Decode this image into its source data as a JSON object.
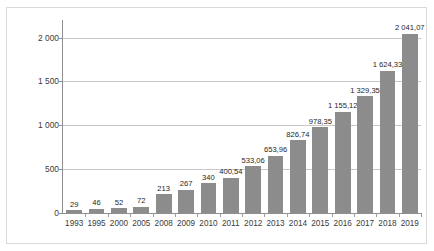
{
  "chart_data": {
    "type": "bar",
    "title": "",
    "xlabel": "",
    "ylabel": "Umsatz in Mio. €",
    "ylim": [
      0,
      2200
    ],
    "yticks": [
      0,
      500,
      1000,
      1500,
      2000
    ],
    "ytick_labels": [
      "0",
      "500",
      "1 000",
      "1 500",
      "2 000"
    ],
    "grid": "horizontal",
    "legend": "none",
    "bar_color": "#8c8c8c",
    "categories": [
      "1993",
      "1995",
      "2000",
      "2005",
      "2008",
      "2009",
      "2010",
      "2011",
      "2012",
      "2013",
      "2014",
      "2015",
      "2016",
      "2017",
      "2018",
      "2019"
    ],
    "values": [
      29,
      46,
      52,
      72,
      213,
      267,
      340,
      400.54,
      533.06,
      653.96,
      826.74,
      978.35,
      1155.12,
      1329.35,
      1624.33,
      2041.07
    ],
    "data_labels": [
      "29",
      "46",
      "52",
      "72",
      "213",
      "267",
      "340",
      "400,54",
      "533,06",
      "653,96",
      "826,74",
      "978,35",
      "1 155,12",
      "1 329,35",
      "1 624,33",
      "2 041,07"
    ]
  }
}
